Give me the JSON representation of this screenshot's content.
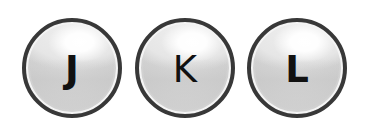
{
  "keys": [
    {
      "label": "J"
    },
    {
      "label": "K"
    },
    {
      "label": "L"
    }
  ],
  "colors": {
    "border": "#383838",
    "body": "#dcdcdc",
    "highlight": "#ffffff",
    "text": "#111111",
    "background": "#ffffff"
  }
}
